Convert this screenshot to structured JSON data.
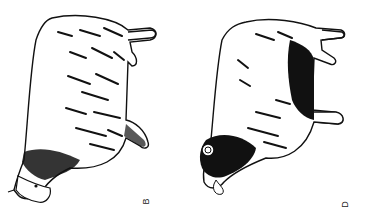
{
  "figures": [
    {
      "id": "B",
      "label": "B",
      "subject": "sheep, light-fleeced, lying rotated, head lower-left",
      "ink": "#111111"
    },
    {
      "id": "D",
      "label": "D",
      "subject": "sheep, dark-faced with dark underside, rotated, head lower-left",
      "ink": "#111111"
    }
  ],
  "colors": {
    "background": "#ffffff",
    "ink": "#111111"
  }
}
